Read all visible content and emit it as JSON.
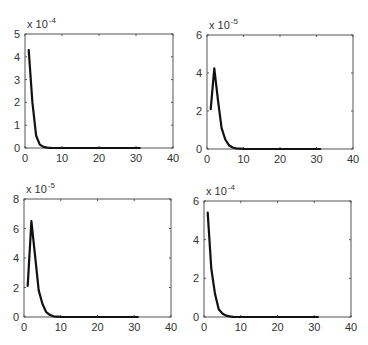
{
  "chart_data": [
    {
      "type": "line",
      "position": "top-left",
      "title": "",
      "xlabel": "",
      "ylabel": "",
      "y_multiplier": "x 10^-4",
      "y_multiplier_base": "x 10",
      "y_multiplier_exp": "-4",
      "xlim": [
        0,
        40
      ],
      "ylim": [
        0,
        5
      ],
      "xticks": [
        0,
        10,
        20,
        30,
        40
      ],
      "yticks": [
        0,
        1,
        2,
        3,
        4,
        5
      ],
      "grid": false,
      "x": [
        1,
        2,
        3,
        4,
        5,
        6,
        7,
        8,
        10,
        15,
        20,
        25,
        31
      ],
      "values": [
        4.3,
        2.0,
        0.55,
        0.15,
        0.05,
        0.015,
        0.005,
        0.002,
        0,
        0,
        0,
        0,
        0
      ]
    },
    {
      "type": "line",
      "position": "top-right",
      "title": "",
      "xlabel": "",
      "ylabel": "",
      "y_multiplier": "x 10^-5",
      "y_multiplier_base": "x 10",
      "y_multiplier_exp": "-5",
      "xlim": [
        0,
        40
      ],
      "ylim": [
        0,
        6
      ],
      "xticks": [
        0,
        10,
        20,
        30,
        40
      ],
      "yticks": [
        0,
        2,
        4,
        6
      ],
      "grid": false,
      "x": [
        1,
        2,
        3,
        4,
        5,
        6,
        7,
        8,
        10,
        15,
        20,
        25,
        31
      ],
      "values": [
        2.1,
        4.25,
        2.6,
        1.1,
        0.5,
        0.2,
        0.08,
        0.03,
        0.005,
        0,
        0,
        0,
        0
      ]
    },
    {
      "type": "line",
      "position": "bottom-left",
      "title": "",
      "xlabel": "",
      "ylabel": "",
      "y_multiplier": "x 10^-5",
      "y_multiplier_base": "x 10",
      "y_multiplier_exp": "-5",
      "xlim": [
        0,
        40
      ],
      "ylim": [
        0,
        8
      ],
      "xticks": [
        0,
        10,
        20,
        30,
        40
      ],
      "yticks": [
        0,
        2,
        4,
        6,
        8
      ],
      "grid": false,
      "x": [
        1,
        2,
        3,
        4,
        5,
        6,
        7,
        8,
        10,
        15,
        20,
        25,
        31
      ],
      "values": [
        2.1,
        6.5,
        4.2,
        1.8,
        0.9,
        0.35,
        0.15,
        0.05,
        0.01,
        0,
        0,
        0,
        0
      ]
    },
    {
      "type": "line",
      "position": "bottom-right",
      "title": "",
      "xlabel": "",
      "ylabel": "",
      "y_multiplier": "x 10^-4",
      "y_multiplier_base": "x 10",
      "y_multiplier_exp": "-4",
      "xlim": [
        0,
        40
      ],
      "ylim": [
        0,
        6
      ],
      "xticks": [
        0,
        10,
        20,
        30,
        40
      ],
      "yticks": [
        0,
        2,
        4,
        6
      ],
      "grid": false,
      "x": [
        1,
        2,
        3,
        4,
        5,
        6,
        7,
        8,
        10,
        15,
        20,
        25,
        31
      ],
      "values": [
        5.4,
        2.5,
        1.2,
        0.4,
        0.18,
        0.07,
        0.03,
        0.01,
        0,
        0,
        0,
        0,
        0
      ]
    }
  ],
  "layout": {
    "axes_px": [
      {
        "left": 25,
        "top": 34,
        "right": 173,
        "bottom": 148
      },
      {
        "left": 207,
        "top": 35,
        "right": 353,
        "bottom": 149
      },
      {
        "left": 24,
        "top": 199,
        "right": 171,
        "bottom": 317
      },
      {
        "left": 204,
        "top": 201,
        "right": 351,
        "bottom": 317
      }
    ]
  }
}
